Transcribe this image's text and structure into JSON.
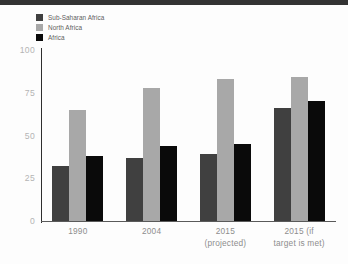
{
  "chart_data": {
    "type": "bar",
    "title": "",
    "xlabel": "",
    "ylabel": "",
    "ylim": [
      0,
      100
    ],
    "yticks": [
      "0",
      "25",
      "50",
      "75",
      "100"
    ],
    "grid": false,
    "legend_position": "top-left",
    "categories": [
      "1990",
      "2004",
      "2015 (projected)",
      "2015 (if target is met)"
    ],
    "category_lines": [
      [
        "1990"
      ],
      [
        "2004"
      ],
      [
        "2015",
        "(projected)"
      ],
      [
        "2015 (if",
        "target is met)"
      ]
    ],
    "series": [
      {
        "name": "Sub-Saharan Africa",
        "color": "#404040",
        "values": [
          32,
          37,
          39,
          66
        ]
      },
      {
        "name": "North Africa",
        "color": "#a8a8a8",
        "values": [
          65,
          78,
          83,
          84
        ]
      },
      {
        "name": "Africa",
        "color": "#0a0a0a",
        "values": [
          38,
          44,
          45,
          70
        ]
      }
    ]
  },
  "legend": {
    "items": [
      {
        "label": "Sub-Saharan Africa",
        "color": "#404040"
      },
      {
        "label": "North Africa",
        "color": "#a8a8a8"
      },
      {
        "label": "Africa",
        "color": "#0a0a0a"
      }
    ]
  },
  "colors": {
    "top_band": "#333333",
    "axis": "#2f2f2f",
    "tick_text": "#b4b4b4",
    "xlabel_text": "#8d8d8d",
    "legend_text": "#5d5d5d",
    "background": "#fdfdfd"
  }
}
